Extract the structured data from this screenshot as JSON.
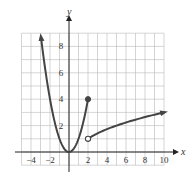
{
  "chart_data": {
    "type": "line",
    "title": "",
    "xlabel": "x",
    "ylabel": "y",
    "xlim": [
      -5,
      10
    ],
    "ylim": [
      -1,
      9
    ],
    "grid": true,
    "x_ticks": [
      -4,
      -2,
      2,
      4,
      6,
      8,
      10
    ],
    "y_ticks": [
      2,
      4,
      6,
      8
    ],
    "series": [
      {
        "name": "piece 1: y = x^2",
        "domain": [
          -3,
          2
        ],
        "points": [
          [
            -3,
            9
          ],
          [
            -2,
            4
          ],
          [
            -1,
            1
          ],
          [
            0,
            0
          ],
          [
            1,
            1
          ],
          [
            2,
            4
          ]
        ],
        "left_end": "arrow",
        "right_end": "closed-dot"
      },
      {
        "name": "piece 2: y = sqrt(x - 1)",
        "domain": [
          2,
          10
        ],
        "points": [
          [
            2,
            1
          ],
          [
            5,
            2
          ],
          [
            10,
            3
          ]
        ],
        "left_end": "open-dot",
        "right_end": "arrow"
      }
    ],
    "markers": [
      {
        "x": 2,
        "y": 4,
        "type": "closed"
      },
      {
        "x": 2,
        "y": 1,
        "type": "open"
      }
    ]
  },
  "labels": {
    "x_axis": "x",
    "y_axis": "y",
    "x_ticks": [
      "−4",
      "−2",
      "2",
      "4",
      "6",
      "8",
      "10"
    ],
    "y_ticks": [
      "2",
      "4",
      "6",
      "8"
    ]
  },
  "colors": {
    "curve": "#444444",
    "grid": "#b8b8b8",
    "axis": "#222222"
  }
}
